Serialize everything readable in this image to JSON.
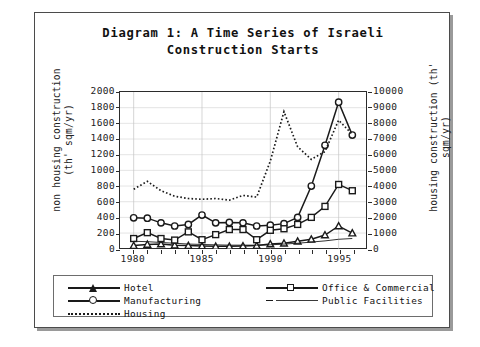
{
  "figure": {
    "title": "Diagram 1: A Time Series of Israeli Construction Starts"
  },
  "chart_data": {
    "type": "line",
    "title": "Diagram 1: A Time Series of Israeli Construction Starts",
    "xlabel": "",
    "ylabel": "non housing construction (th' sqm/yr)",
    "y2label": "housing construction (th' sqm/yr)",
    "xlim": [
      1979,
      1997
    ],
    "ylim": [
      0,
      2000
    ],
    "y2lim": [
      0,
      10000
    ],
    "grid": true,
    "legend_position": "bottom",
    "x": [
      1980,
      1981,
      1982,
      1983,
      1984,
      1985,
      1986,
      1987,
      1988,
      1989,
      1990,
      1991,
      1992,
      1993,
      1994,
      1995,
      1996
    ],
    "y_ticks": [
      0,
      200,
      400,
      600,
      800,
      1000,
      1200,
      1400,
      1600,
      1800,
      2000
    ],
    "y2_ticks": [
      0,
      1000,
      2000,
      3000,
      4000,
      5000,
      6000,
      7000,
      8000,
      9000,
      10000
    ],
    "x_ticks": [
      1980,
      1985,
      1990,
      1995
    ],
    "series": [
      {
        "name": "Hotel",
        "marker": "triangle",
        "line": "solid",
        "axis": "left",
        "values": [
          40,
          55,
          60,
          45,
          40,
          35,
          30,
          30,
          35,
          40,
          60,
          70,
          95,
          120,
          175,
          290,
          200
        ]
      },
      {
        "name": "Manufacturing",
        "marker": "circle",
        "line": "solid",
        "axis": "left",
        "values": [
          395,
          390,
          330,
          290,
          310,
          430,
          330,
          335,
          330,
          290,
          300,
          320,
          400,
          800,
          1320,
          1870,
          1450
        ]
      },
      {
        "name": "Housing",
        "marker": "none",
        "line": "dotted",
        "axis": "right",
        "values": [
          3800,
          4300,
          3700,
          3350,
          3200,
          3150,
          3200,
          3100,
          3400,
          3300,
          5600,
          8750,
          6500,
          5700,
          6200,
          8200,
          7300
        ]
      },
      {
        "name": "Office & Commercial",
        "marker": "square",
        "line": "solid",
        "axis": "left",
        "values": [
          130,
          205,
          130,
          110,
          215,
          115,
          180,
          245,
          245,
          115,
          235,
          255,
          310,
          400,
          540,
          820,
          740
        ]
      },
      {
        "name": "Public Facilities",
        "marker": "none",
        "line": "thin",
        "axis": "left",
        "values": [
          95,
          90,
          80,
          70,
          60,
          55,
          50,
          45,
          45,
          45,
          50,
          60,
          70,
          85,
          100,
          120,
          130
        ]
      }
    ]
  },
  "legend": {
    "items": [
      {
        "label": "Hotel",
        "symbol": "line-triangle-marker"
      },
      {
        "label": "Manufacturing",
        "symbol": "line-circle-marker"
      },
      {
        "label": "Housing",
        "symbol": "dotted-line"
      },
      {
        "label": "Office & Commercial",
        "symbol": "line-square-marker"
      },
      {
        "label": "Public Facilities",
        "symbol": "thin-line"
      }
    ]
  },
  "colors": {
    "line": "#1a1a1a",
    "frame": "#4b4b4b",
    "grid": "#c9c9c9",
    "text": "#111111"
  }
}
